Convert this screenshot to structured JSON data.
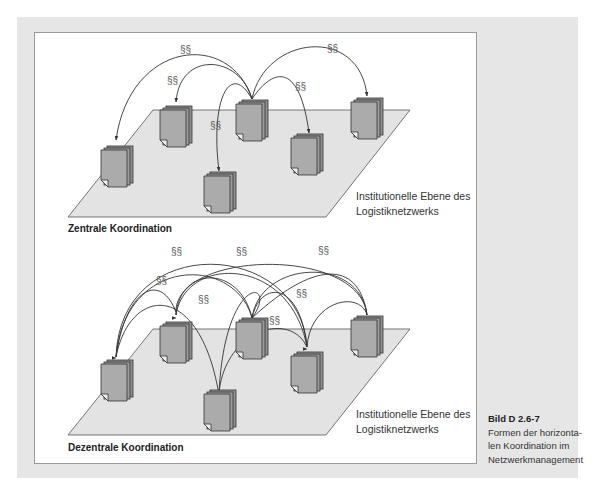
{
  "figure": {
    "caption_id": "Bild D 2.6-7",
    "caption_lines": [
      "Formen der horizonta-",
      "len Koordination im",
      "Netzwerkmanagement"
    ]
  },
  "panels": [
    {
      "title": "Zentrale Koordination",
      "plane_label_lines": [
        "Institutionelle Ebene des",
        "Logistiknetzwerks"
      ],
      "arc_label": "§§",
      "nodes": [
        "doc-left",
        "doc-back-left",
        "doc-center-hub",
        "doc-front-center",
        "doc-right-middle",
        "doc-back-right"
      ]
    },
    {
      "title": "Dezentrale Koordination",
      "plane_label_lines": [
        "Institutionelle Ebene des",
        "Logistiknetzwerks"
      ],
      "arc_label": "§§",
      "nodes": [
        "doc-left",
        "doc-back-left",
        "doc-center",
        "doc-front-center",
        "doc-right-middle",
        "doc-back-right"
      ]
    }
  ],
  "colors": {
    "background": "#e6e6e6",
    "plane": "#e3e3e3",
    "document": "#a9a9a9",
    "stroke": "#333333"
  }
}
